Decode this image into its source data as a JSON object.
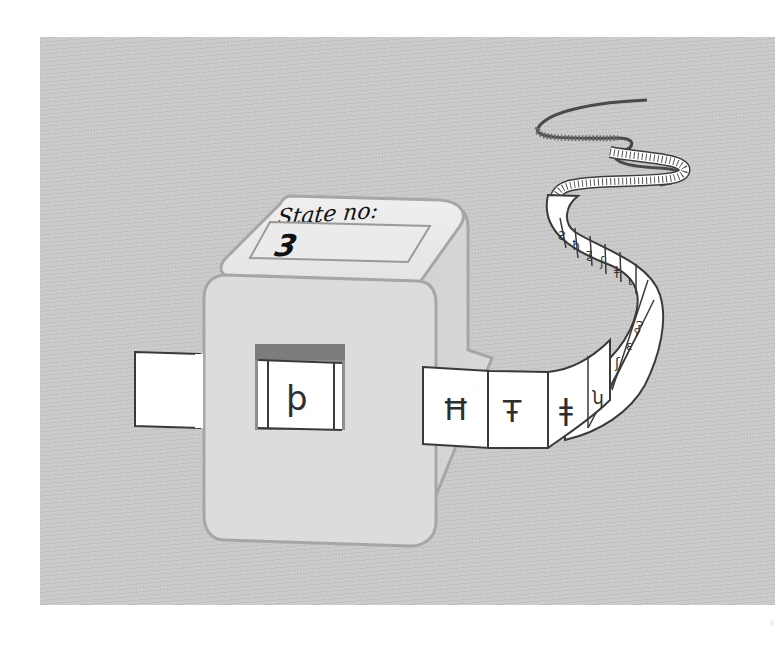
{
  "figure": {
    "background_color": "#c9c9c9",
    "page_color": "#ffffff"
  },
  "machine": {
    "state_label": "State no:",
    "state_value": "3",
    "head_symbol": "þ",
    "body_color": "#dedede",
    "outline_color": "#a6a6a6"
  },
  "tape": {
    "left_cell_symbol": "",
    "cells": [
      {
        "symbol": "Ħ"
      },
      {
        "symbol": "Ŧ"
      },
      {
        "symbol": "ǂ"
      },
      {
        "symbol": "ʮ"
      },
      {
        "symbol": "ʃ"
      },
      {
        "symbol": "ɛ"
      },
      {
        "symbol": "ʕ"
      }
    ],
    "far_cells": [
      "Ƨ",
      "ħ",
      "ƺ",
      "ʃ",
      "ǂ",
      "ɩ",
      "Ɂ"
    ],
    "cell_color": "#ffffff",
    "line_color": "#3a3a3a"
  },
  "corner_mark": "ˀ"
}
